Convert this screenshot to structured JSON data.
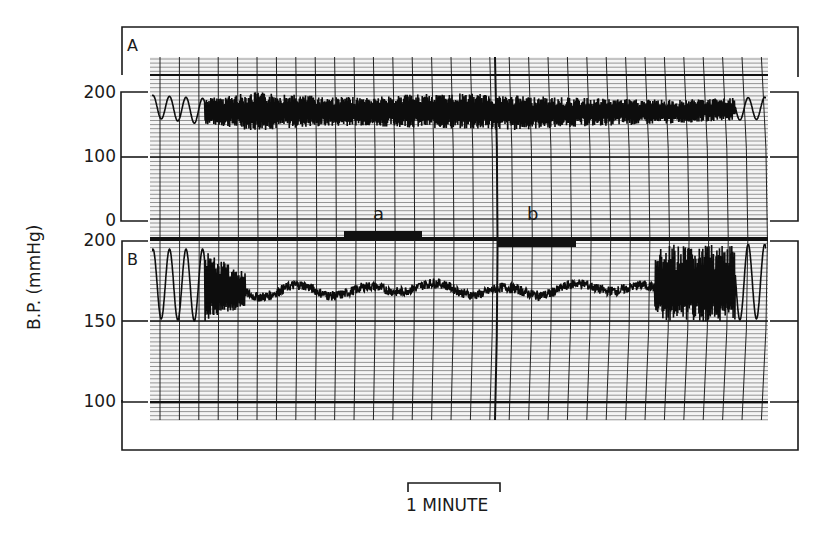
{
  "chart_data": [
    {
      "type": "line",
      "panel": "A",
      "title": "A",
      "ylabel": "B.P. (mmHg)",
      "xlabel": "",
      "y_ticks": [
        0,
        100,
        200
      ],
      "ylim": [
        0,
        200
      ],
      "time_scale": "1 MINUTE",
      "grid": true,
      "description": "Chart-recorder blood pressure trace; wide-amplitude oscillation between ~140 and ~190 mmHg, slow regular waves at both ends",
      "x_minutes": [
        0,
        0.5,
        1,
        1.5,
        2,
        2.5,
        3,
        3.5,
        4,
        4.5,
        5,
        5.5,
        6
      ],
      "mean_values": [
        180,
        170,
        170,
        172,
        168,
        170,
        172,
        170,
        168,
        170,
        168,
        172,
        175
      ],
      "upper_envelope": [
        195,
        190,
        200,
        195,
        192,
        196,
        198,
        195,
        192,
        190,
        188,
        190,
        192
      ],
      "lower_envelope": [
        160,
        150,
        140,
        145,
        148,
        145,
        142,
        140,
        145,
        148,
        150,
        155,
        158
      ]
    },
    {
      "type": "line",
      "panel": "B",
      "title": "B",
      "ylabel": "B.P. (mmHg)",
      "xlabel": "",
      "y_ticks": [
        100,
        150,
        200
      ],
      "ylim": [
        100,
        200
      ],
      "time_scale": "1 MINUTE",
      "grid": true,
      "description": "Expanded-scale blood pressure trace; large oscillations at start and end, stable ~165-175 mmHg during marked periods a and b",
      "x_minutes": [
        0,
        0.5,
        1,
        1.5,
        2,
        2.5,
        3,
        3.5,
        4,
        4.5,
        5,
        5.5,
        6
      ],
      "mean_values": [
        172,
        170,
        168,
        170,
        168,
        172,
        170,
        168,
        170,
        172,
        168,
        170,
        172
      ],
      "upper_envelope": [
        195,
        195,
        178,
        180,
        178,
        185,
        182,
        178,
        180,
        180,
        198,
        198,
        198
      ],
      "lower_envelope": [
        152,
        150,
        160,
        165,
        162,
        160,
        165,
        162,
        162,
        165,
        150,
        150,
        152
      ],
      "annotations": [
        {
          "label": "a",
          "start_minute": 2.3,
          "end_minute": 3.1
        },
        {
          "label": "b",
          "start_minute": 3.8,
          "end_minute": 4.6
        }
      ]
    }
  ],
  "figure": {
    "ylabel": "B.P. (mmHg)",
    "panel_a": {
      "letter": "A",
      "ticks": [
        "200",
        "100",
        "0"
      ]
    },
    "panel_b": {
      "letter": "B",
      "ticks": [
        "200",
        "150",
        "100"
      ]
    },
    "markers": [
      {
        "label": "a"
      },
      {
        "label": "b"
      }
    ],
    "scale_bar": "1 MINUTE"
  }
}
